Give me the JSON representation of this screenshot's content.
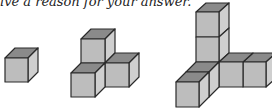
{
  "caption": "ive a reason for your answer.",
  "figures": [
    {
      "name": "single-cube",
      "cube_count": 1
    },
    {
      "name": "four-cube-corner",
      "cube_count": 4
    },
    {
      "name": "seven-cube-corner",
      "cube_count": 7
    }
  ],
  "colors": {
    "top": "#8a8a8a",
    "front": "#bdbdbd",
    "side": "#cfcfcf",
    "edge": "#2a2a2a"
  }
}
